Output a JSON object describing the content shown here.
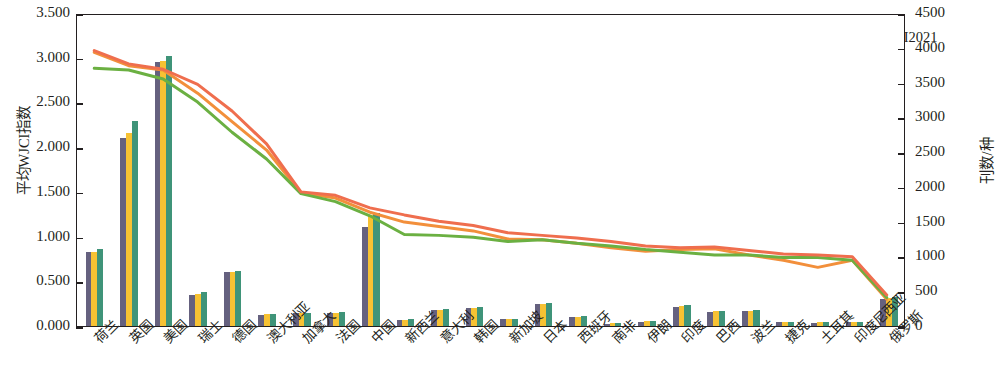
{
  "chart_data": {
    "type": "bar",
    "title": "",
    "xlabel": "",
    "ylabel": "平均WJCI指数",
    "ylabel_right": "刊数/种",
    "ylim": [
      0,
      3.5
    ],
    "ylim_right": [
      0,
      4500
    ],
    "ytick_labels": [
      "0.000",
      "0.500",
      "1.000",
      "1.500",
      "2.000",
      "2.500",
      "3.000",
      "3.500"
    ],
    "ytick_labels_right": [
      "0",
      "500",
      "1000",
      "1500",
      "2000",
      "2500",
      "3000",
      "3500",
      "4000",
      "4500"
    ],
    "grid": false,
    "legend_position": "top",
    "categories": [
      "荷兰",
      "英国",
      "美国",
      "瑞士",
      "德国",
      "澳大利亚",
      "加拿大",
      "法国",
      "中国",
      "新西兰",
      "意大利",
      "韩国",
      "新加坡",
      "日本",
      "西班牙",
      "南非",
      "伊朗",
      "印度",
      "巴西",
      "波兰",
      "捷克",
      "土耳其",
      "印度尼西亚",
      "俄罗斯"
    ],
    "series": [
      {
        "name": "刊数2019",
        "type": "bar",
        "axis": "right",
        "color": "#65617f",
        "values": [
          1060,
          2710,
          3800,
          450,
          770,
          165,
          180,
          185,
          1430,
          85,
          225,
          255,
          95,
          310,
          130,
          35,
          60,
          275,
          200,
          215,
          55,
          50,
          55,
          385
        ]
      },
      {
        "name": "刊数2020",
        "type": "bar",
        "axis": "right",
        "color": "#f7c233",
        "values": [
          1070,
          2780,
          3810,
          460,
          780,
          170,
          185,
          190,
          1590,
          90,
          235,
          265,
          100,
          320,
          135,
          40,
          65,
          285,
          210,
          220,
          60,
          55,
          60,
          400
        ]
      },
      {
        "name": "刊数2021",
        "type": "bar",
        "axis": "right",
        "color": "#3f9479",
        "values": [
          1110,
          2950,
          3880,
          485,
          790,
          175,
          190,
          195,
          1620,
          95,
          245,
          275,
          105,
          330,
          140,
          45,
          70,
          295,
          215,
          225,
          62,
          58,
          62,
          420
        ]
      },
      {
        "name": "刊均WJCI2019",
        "type": "line",
        "axis": "left",
        "color": "#f28f3b",
        "values": [
          3.08,
          2.93,
          2.88,
          2.62,
          2.3,
          1.98,
          1.5,
          1.44,
          1.28,
          1.17,
          1.12,
          1.07,
          0.98,
          0.97,
          0.93,
          0.88,
          0.84,
          0.86,
          0.87,
          0.8,
          0.74,
          0.66,
          0.74,
          0.3
        ]
      },
      {
        "name": "刊均WJCI2020",
        "type": "line",
        "axis": "left",
        "color": "#6bb042",
        "values": [
          2.9,
          2.88,
          2.78,
          2.52,
          2.18,
          1.88,
          1.49,
          1.4,
          1.24,
          1.03,
          1.02,
          1.0,
          0.95,
          0.97,
          0.93,
          0.9,
          0.86,
          0.83,
          0.8,
          0.8,
          0.77,
          0.77,
          0.74,
          0.32
        ]
      },
      {
        "name": "刊均WJCI2021",
        "type": "line",
        "axis": "left",
        "color": "#ef6e4e",
        "values": [
          3.1,
          2.95,
          2.89,
          2.72,
          2.42,
          2.05,
          1.51,
          1.47,
          1.33,
          1.25,
          1.18,
          1.13,
          1.05,
          1.02,
          0.99,
          0.95,
          0.9,
          0.88,
          0.89,
          0.85,
          0.81,
          0.8,
          0.78,
          0.35
        ]
      }
    ]
  }
}
